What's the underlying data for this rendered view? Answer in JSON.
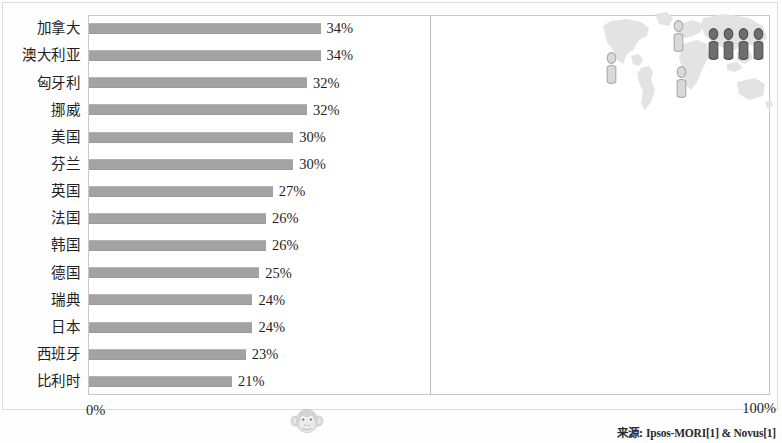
{
  "chart_data": {
    "type": "bar",
    "orientation": "horizontal",
    "title": "",
    "xlabel": "",
    "ylabel": "",
    "xlim": [
      0,
      100
    ],
    "xticks": [
      "0%",
      "100%"
    ],
    "grid": true,
    "gridline_at": 50,
    "categories": [
      "加拿大",
      "澳大利亚",
      "匈牙利",
      "挪威",
      "美国",
      "芬兰",
      "英国",
      "法国",
      "韩国",
      "德国",
      "瑞典",
      "日本",
      "西班牙",
      "比利时"
    ],
    "values": [
      34,
      34,
      32,
      32,
      30,
      30,
      27,
      26,
      26,
      25,
      24,
      24,
      23,
      21
    ],
    "value_labels": [
      "34%",
      "34%",
      "32%",
      "32%",
      "30%",
      "30%",
      "27%",
      "26%",
      "26%",
      "25%",
      "24%",
      "24%",
      "23%",
      "21%"
    ],
    "bar_color": "#a3a3a3",
    "legend": []
  },
  "axis": {
    "left_tick": "0%",
    "right_tick": "100%"
  },
  "footer": {
    "source_label": "来源",
    "source_separator": ":",
    "source_text": "Ipsos-MORI[1] & Novus[1]"
  },
  "watermark": {
    "monkey_icon": "monkey-face-icon"
  },
  "map_inset": {
    "name": "world-map-inset",
    "map_icon": "world-map-icon",
    "people": [
      {
        "icon": "person-icon",
        "shade": "light",
        "x": 8,
        "y": 46
      },
      {
        "icon": "person-icon",
        "shade": "light",
        "x": 75,
        "y": 14
      },
      {
        "icon": "person-icon",
        "shade": "light",
        "x": 78,
        "y": 60
      },
      {
        "icon": "person-icon",
        "shade": "dark",
        "x": 110,
        "y": 22
      },
      {
        "icon": "person-icon",
        "shade": "dark",
        "x": 125,
        "y": 22
      },
      {
        "icon": "person-icon",
        "shade": "dark",
        "x": 140,
        "y": 22
      },
      {
        "icon": "person-icon",
        "shade": "dark",
        "x": 155,
        "y": 22
      }
    ],
    "light_color": "#d9d9d9",
    "dark_color": "#6e6e6e",
    "land_color": "#e2e2e2"
  }
}
